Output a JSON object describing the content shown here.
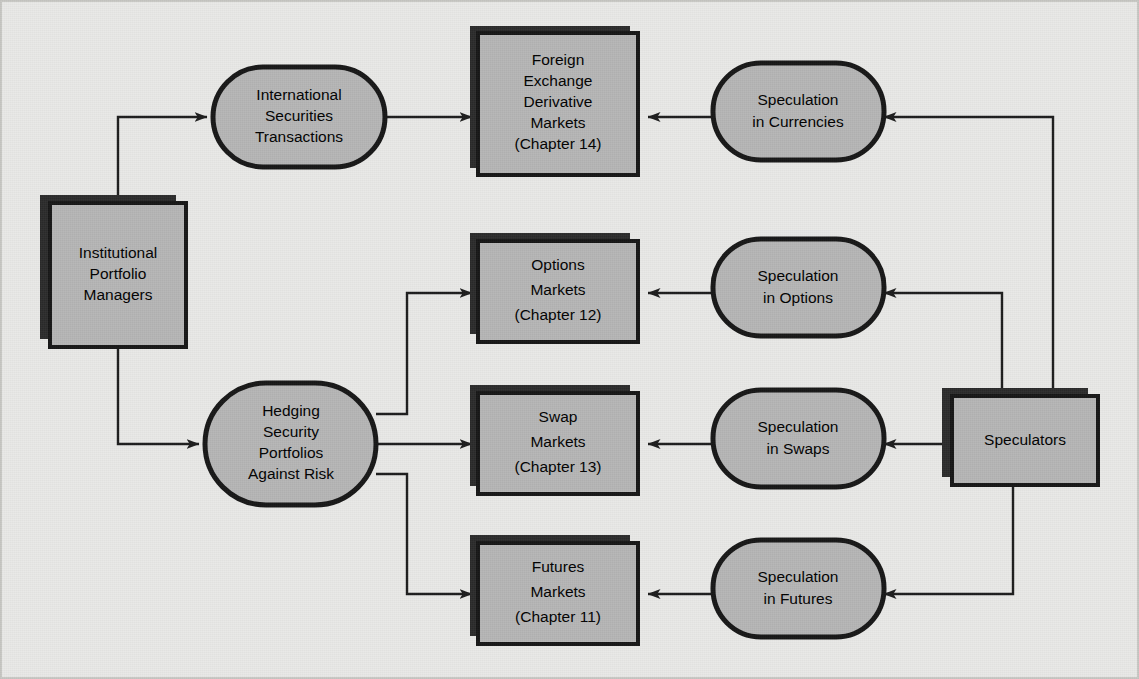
{
  "diagram": {
    "background_color": "#e9e9e7",
    "node_fill_color": "#b6b6b6",
    "node_border_color": "#161616",
    "shadow_color": "#2b2b2b",
    "connector_color": "#1c1c1c"
  },
  "nodes": {
    "institutional_portfolio_managers": {
      "shape": "box",
      "lines": [
        "Institutional",
        "Portfolio",
        "Managers"
      ]
    },
    "international_securities_transactions": {
      "shape": "oval",
      "lines": [
        "International",
        "Securities",
        "Transactions"
      ]
    },
    "hedging_security_portfolios": {
      "shape": "oval",
      "lines": [
        "Hedging",
        "Security",
        "Portfolios",
        "Against Risk"
      ]
    },
    "foreign_exchange_derivative_markets": {
      "shape": "box",
      "lines": [
        "Foreign",
        "Exchange",
        "Derivative",
        "Markets",
        "(Chapter 14)"
      ]
    },
    "options_markets": {
      "shape": "box",
      "lines": [
        "Options",
        "Markets",
        "(Chapter 12)"
      ]
    },
    "swap_markets": {
      "shape": "box",
      "lines": [
        "Swap",
        "Markets",
        "(Chapter 13)"
      ]
    },
    "futures_markets": {
      "shape": "box",
      "lines": [
        "Futures",
        "Markets",
        "(Chapter 11)"
      ]
    },
    "speculation_in_currencies": {
      "shape": "oval",
      "lines": [
        "Speculation",
        "in Currencies"
      ]
    },
    "speculation_in_options": {
      "shape": "oval",
      "lines": [
        "Speculation",
        "in Options"
      ]
    },
    "speculation_in_swaps": {
      "shape": "oval",
      "lines": [
        "Speculation",
        "in Swaps"
      ]
    },
    "speculation_in_futures": {
      "shape": "oval",
      "lines": [
        "Speculation",
        "in Futures"
      ]
    },
    "speculators": {
      "shape": "box",
      "lines": [
        "Speculators"
      ]
    }
  },
  "edges": [
    {
      "from": "institutional_portfolio_managers",
      "to": "international_securities_transactions"
    },
    {
      "from": "institutional_portfolio_managers",
      "to": "hedging_security_portfolios"
    },
    {
      "from": "international_securities_transactions",
      "to": "foreign_exchange_derivative_markets"
    },
    {
      "from": "hedging_security_portfolios",
      "to": "options_markets"
    },
    {
      "from": "hedging_security_portfolios",
      "to": "swap_markets"
    },
    {
      "from": "hedging_security_portfolios",
      "to": "futures_markets"
    },
    {
      "from": "speculation_in_currencies",
      "to": "foreign_exchange_derivative_markets"
    },
    {
      "from": "speculation_in_options",
      "to": "options_markets"
    },
    {
      "from": "speculation_in_swaps",
      "to": "swap_markets"
    },
    {
      "from": "speculation_in_futures",
      "to": "futures_markets"
    },
    {
      "from": "speculators",
      "to": "speculation_in_currencies"
    },
    {
      "from": "speculators",
      "to": "speculation_in_options"
    },
    {
      "from": "speculators",
      "to": "speculation_in_swaps"
    },
    {
      "from": "speculators",
      "to": "speculation_in_futures"
    }
  ]
}
